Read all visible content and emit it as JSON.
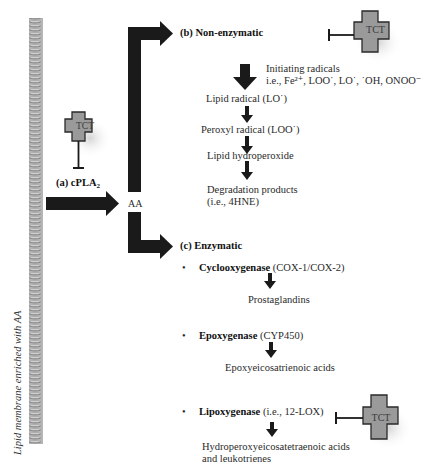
{
  "membrane": {
    "label": "Lipid membrane enriched with AA"
  },
  "step_a": {
    "label_prefix": "(a) cPLA",
    "label_sub": "2",
    "inhibitor": "TCT",
    "product": "AA"
  },
  "step_b": {
    "title": "(b) Non-enzymatic",
    "inhibitor": "TCT",
    "initiating_line1": "Initiating radicals",
    "initiating_line2": "i.e., Fe²⁺, LOO˙, LO˙, ˙OH, ONOO⁻",
    "chain": [
      "Lipid radical (LO˙)",
      "Peroxyl radical (LOO˙)",
      "Lipid hydroperoxide",
      "Degradation products"
    ],
    "degradation_example": "(i.e., 4HNE)"
  },
  "step_c": {
    "title": "(c) Enzymatic",
    "enzymes": [
      {
        "name": "Cyclooxygenase",
        "detail": "(COX-1/COX-2)",
        "product_line1": "Prostaglandins",
        "product_line2": ""
      },
      {
        "name": "Epoxygenase",
        "detail": "(CYP450)",
        "product_line1": "Epoxyeicosatrienoic acids",
        "product_line2": ""
      },
      {
        "name": "Lipoxygenase",
        "detail": "(i.e., 12-LOX)",
        "product_line1": "Hydroperoxyeicosatetraenoic acids",
        "product_line2": "and leukotrienes"
      }
    ],
    "inhibitor": "TCT",
    "bullet": "•"
  },
  "colors": {
    "arrow": "#1a1a1a",
    "cross_fill": "#9a9a9a",
    "cross_border": "#2a2a2a",
    "membrane": "#9c9c9c"
  }
}
